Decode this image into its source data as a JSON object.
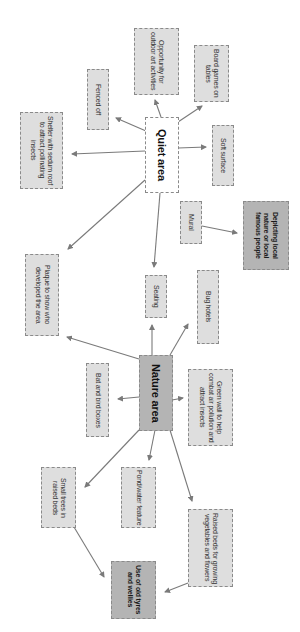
{
  "diagram": {
    "type": "mind-map",
    "orientation": "rotated-90-clockwise",
    "colors": {
      "node_fill": "#dedede",
      "node_fill_dark": "#b4b4b4",
      "hub_fill": "#ffffff",
      "border": "#8a8a8a",
      "arrow": "#7a7a7a"
    },
    "nodes": {
      "quiet_area": "Quiet area",
      "fenced_off": "Fenced off",
      "outdoor_art": "Opportunity for outdoor art activities",
      "board_games": "Board games on tables",
      "soft_surface": "Soft surface",
      "shelter": "Shelter with sedum roof to attract pollinating insects",
      "mural": "Mural",
      "depicting": "Depicting local nature or local famous people",
      "plaque": "Plaque to show who developed the area",
      "seating": "Seating",
      "bug_hotels": "Bug hotels",
      "nature_area": "Nature area",
      "bat_bird_boxes": "Bat and bird boxes",
      "green_wall": "Green wall to help combat air pollution and attract insects",
      "small_trees": "Small trees in raised beds",
      "pond": "Pond/water feature",
      "raised_beds": "Raised beds for growing vegetables and flowers",
      "old_tyres": "Use of old tyres and wellies"
    },
    "edges": [
      {
        "from": "Quiet area",
        "to": "Fenced off"
      },
      {
        "from": "Quiet area",
        "to": "Opportunity for outdoor art activities"
      },
      {
        "from": "Quiet area",
        "to": "Board games on tables"
      },
      {
        "from": "Quiet area",
        "to": "Soft surface"
      },
      {
        "from": "Quiet area",
        "to": "Shelter with sedum roof to attract pollinating insects"
      },
      {
        "from": "Quiet area",
        "to": "Plaque to show who developed the area"
      },
      {
        "from": "Quiet area",
        "to": "Seating"
      },
      {
        "from": "Mural",
        "to": "Depicting local nature or local famous people"
      },
      {
        "from": "Nature area",
        "to": "Plaque to show who developed the area"
      },
      {
        "from": "Nature area",
        "to": "Seating"
      },
      {
        "from": "Nature area",
        "to": "Bug hotels"
      },
      {
        "from": "Nature area",
        "to": "Bat and bird boxes"
      },
      {
        "from": "Nature area",
        "to": "Green wall to help combat air pollution and attract insects"
      },
      {
        "from": "Nature area",
        "to": "Small trees in raised beds"
      },
      {
        "from": "Nature area",
        "to": "Pond/water feature"
      },
      {
        "from": "Nature area",
        "to": "Raised beds for growing vegetables and flowers"
      },
      {
        "from": "Small trees in raised beds",
        "to": "Use of old tyres and wellies"
      },
      {
        "from": "Raised beds for growing vegetables and flowers",
        "to": "Use of old tyres and wellies"
      }
    ]
  }
}
